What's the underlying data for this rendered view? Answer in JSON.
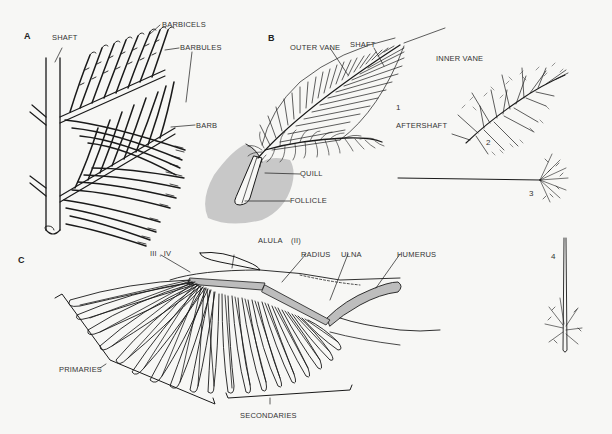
{
  "panels": {
    "a": {
      "letter": "A",
      "labels": {
        "shaft": "SHAFT",
        "barbicels": "BARBICELS",
        "barbules": "BARBULES",
        "barb": "BARB"
      }
    },
    "b": {
      "letter": "B",
      "labels": {
        "outer_vane": "OUTER VANE",
        "shaft": "SHAFT",
        "inner_vane": "INNER VANE",
        "aftershaft": "AFTERSHAFT",
        "quill": "QUILL",
        "follicle": "FOLLICLE"
      },
      "feather_numbers": [
        "1",
        "2",
        "3",
        "4"
      ]
    },
    "c": {
      "letter": "C",
      "labels": {
        "digits_iii_iv": "III , IV",
        "alula": "ALULA",
        "alula_digit": "(II)",
        "radius": "RADIUS",
        "ulna": "ULNA",
        "humerus": "HUMERUS",
        "primaries": "PRIMARIES",
        "secondaries": "SECONDARIES"
      }
    }
  },
  "colors": {
    "background": "#f7f7f5",
    "ink": "#1a1a1a",
    "skin_shade": "#c8c8c8",
    "bone_shade": "#bdbdbd"
  }
}
